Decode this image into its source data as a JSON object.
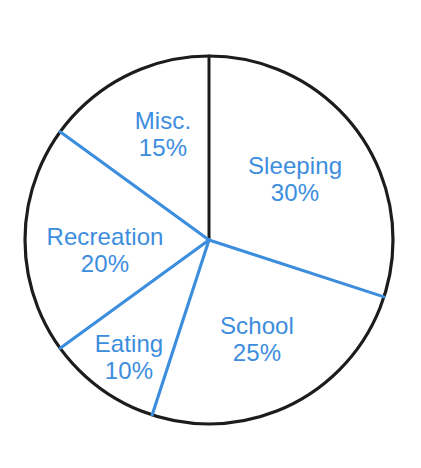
{
  "chart_data": {
    "type": "pie",
    "title": "",
    "subtitle": "",
    "xlabel": "",
    "ylabel": "",
    "legend_position": "none",
    "grid": false,
    "unit": "%",
    "total": 100,
    "start_angle_deg": 0,
    "direction": "clockwise",
    "categories": [
      "Sleeping",
      "School",
      "Eating",
      "Recreation",
      "Misc."
    ],
    "values": [
      30,
      25,
      10,
      20,
      15
    ],
    "slices": [
      {
        "label": "Sleeping",
        "value": 30,
        "value_text": "30%",
        "start_deg": 0,
        "end_deg": 108,
        "label_x": 295,
        "label_y": 180
      },
      {
        "label": "School",
        "value": 25,
        "value_text": "25%",
        "start_deg": 108,
        "end_deg": 198,
        "label_x": 257,
        "label_y": 340
      },
      {
        "label": "Eating",
        "value": 10,
        "value_text": "10%",
        "start_deg": 198,
        "end_deg": 234,
        "label_x": 129,
        "label_y": 358
      },
      {
        "label": "Recreation",
        "value": 20,
        "value_text": "20%",
        "start_deg": 234,
        "end_deg": 306,
        "label_x": 105,
        "label_y": 251
      },
      {
        "label": "Misc.",
        "value": 15,
        "value_text": "15%",
        "start_deg": 306,
        "end_deg": 360,
        "label_x": 163,
        "label_y": 135
      }
    ],
    "colors": {
      "slice_fill": "#ffffff",
      "outline": "#1c1c1c",
      "divider": "#3c8dde",
      "first_divider": "#1c1c1c",
      "label_text": "#3c8dde",
      "background": "#ffffff"
    },
    "geometry": {
      "center_x": 209,
      "center_y": 240,
      "radius": 184
    }
  }
}
